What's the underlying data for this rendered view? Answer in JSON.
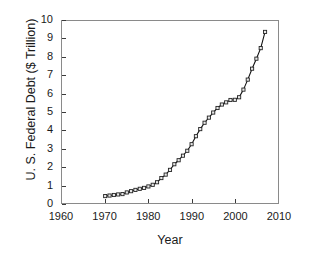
{
  "chart_data": {
    "type": "line",
    "title": "",
    "xlabel": "Year",
    "ylabel": "U. S. Federal Debt ($ Trillion)",
    "xlim": [
      1960,
      2010
    ],
    "ylim": [
      0,
      10
    ],
    "xticks": [
      1960,
      1970,
      1980,
      1990,
      2000,
      2010
    ],
    "yticks": [
      0,
      1,
      2,
      3,
      4,
      5,
      6,
      7,
      8,
      9,
      10
    ],
    "grid": false,
    "legend": null,
    "marker": "square",
    "line_color": "#111111",
    "marker_face_color": "#e8e8e8",
    "marker_edge_color": "#222222",
    "x": [
      1970,
      1971,
      1972,
      1973,
      1974,
      1975,
      1976,
      1977,
      1978,
      1979,
      1980,
      1981,
      1982,
      1983,
      1984,
      1985,
      1986,
      1987,
      1988,
      1989,
      1990,
      1991,
      1992,
      1993,
      1994,
      1995,
      1996,
      1997,
      1998,
      1999,
      2000,
      2001,
      2002,
      2003,
      2004,
      2005,
      2006,
      2007
    ],
    "y": [
      0.38,
      0.41,
      0.44,
      0.47,
      0.49,
      0.58,
      0.65,
      0.72,
      0.78,
      0.83,
      0.91,
      1.0,
      1.14,
      1.37,
      1.56,
      1.82,
      2.13,
      2.35,
      2.6,
      2.87,
      3.23,
      3.67,
      4.06,
      4.41,
      4.69,
      4.97,
      5.22,
      5.41,
      5.53,
      5.66,
      5.67,
      5.81,
      6.23,
      6.78,
      7.38,
      7.93,
      8.51,
      9.4
    ],
    "series": [
      {
        "name": "U. S. Federal Debt",
        "values": [
          0.38,
          0.41,
          0.44,
          0.47,
          0.49,
          0.58,
          0.65,
          0.72,
          0.78,
          0.83,
          0.91,
          1.0,
          1.14,
          1.37,
          1.56,
          1.82,
          2.13,
          2.35,
          2.6,
          2.87,
          3.23,
          3.67,
          4.06,
          4.41,
          4.69,
          4.97,
          5.22,
          5.41,
          5.53,
          5.66,
          5.67,
          5.81,
          6.23,
          6.78,
          7.38,
          7.93,
          8.51,
          9.4
        ]
      }
    ]
  }
}
